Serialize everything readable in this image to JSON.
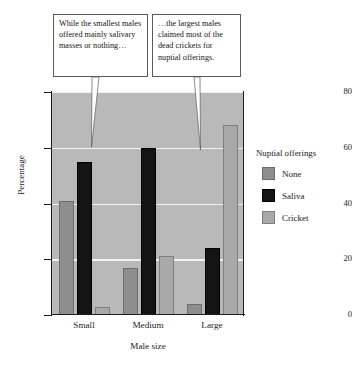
{
  "chart_data": {
    "type": "bar",
    "title": "",
    "subtitle": "",
    "xlabel": "Male size",
    "ylabel": "Percentage",
    "categories": [
      "Small",
      "Medium",
      "Large"
    ],
    "series": [
      {
        "name": "None",
        "values": [
          41,
          17,
          4
        ],
        "color": "#8e8e8e"
      },
      {
        "name": "Saliva",
        "values": [
          55,
          60,
          24
        ],
        "color": "#141414"
      },
      {
        "name": "Cricket",
        "values": [
          3,
          21,
          68
        ],
        "color": "#a9a9a9"
      }
    ],
    "ylim": [
      0,
      80
    ],
    "yticks": [
      0,
      20,
      40,
      60,
      80
    ],
    "ytick_labels": [
      "0",
      "20",
      "40",
      "60",
      "80"
    ],
    "grid": true,
    "grid_color": "#f2f2f2",
    "plot_background": "#b9b9b9",
    "legend": {
      "title": "Nuptial offerings",
      "position": "right",
      "entries": [
        "None",
        "Saliva",
        "Cricket"
      ]
    },
    "annotations": [
      {
        "id": "callout-left",
        "text": "While the smallest males offered mainly salivary masses or nothing…",
        "points_to": "Small / Saliva bar"
      },
      {
        "id": "callout-right",
        "text": "…the largest males claimed most of the dead crickets for nuptial offerings.",
        "points_to": "Large / Cricket bar"
      }
    ]
  }
}
